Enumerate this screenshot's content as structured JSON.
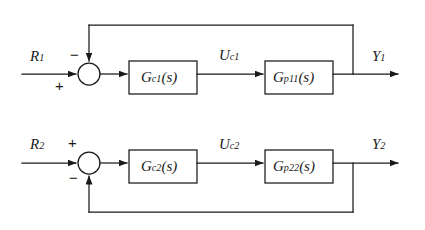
{
  "diagram": {
    "background_color": "#ffffff",
    "line_color": "#1a1a1a",
    "text_color": "#1a1a1a",
    "loops": [
      {
        "id": "loop1",
        "input_label": "R",
        "input_subscript": "1",
        "output_label": "Y",
        "output_subscript": "1",
        "intermediate_label": "U",
        "intermediate_subscript": "c1",
        "controller_label": "G",
        "controller_subscript": "c1",
        "controller_arg": "(s)",
        "plant_label": "G",
        "plant_subscript": "p11",
        "plant_arg": "(s)",
        "summing_sign_input": "+",
        "summing_sign_feedback": "−",
        "feedback_entry": "top"
      },
      {
        "id": "loop2",
        "input_label": "R",
        "input_subscript": "2",
        "output_label": "Y",
        "output_subscript": "2",
        "intermediate_label": "U",
        "intermediate_subscript": "c2",
        "controller_label": "G",
        "controller_subscript": "c2",
        "controller_arg": "(s)",
        "plant_label": "G",
        "plant_subscript": "p22",
        "plant_arg": "(s)",
        "summing_sign_input": "+",
        "summing_sign_feedback": "−",
        "feedback_entry": "bottom"
      }
    ]
  }
}
